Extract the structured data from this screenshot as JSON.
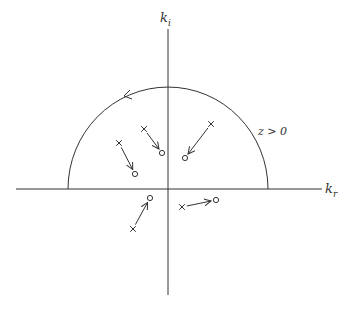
{
  "diagram": {
    "axes": {
      "vertical_label": "k",
      "vertical_sub": "i",
      "horizontal_label": "k",
      "horizontal_sub": "r"
    },
    "region_label": "z > 0",
    "contour": {
      "shape": "upper semicircle",
      "direction": "counterclockwise",
      "center": [
        168,
        189
      ],
      "radius": 100
    },
    "colors": {
      "stroke": "#333333",
      "background": "#ffffff"
    },
    "trajectories": [
      {
        "id": 1,
        "pole_x": [
          119,
          143
        ],
        "zero_o": [
          135,
          174
        ]
      },
      {
        "id": 2,
        "pole_x": [
          144,
          129
        ],
        "zero_o": [
          162,
          153
        ]
      },
      {
        "id": 3,
        "pole_x": [
          211,
          124
        ],
        "zero_o": [
          185,
          158
        ]
      },
      {
        "id": 4,
        "pole_x": [
          133,
          229
        ],
        "zero_o": [
          150,
          198
        ]
      },
      {
        "id": 5,
        "pole_x": [
          182,
          207
        ],
        "zero_o": [
          216,
          200
        ]
      }
    ]
  }
}
